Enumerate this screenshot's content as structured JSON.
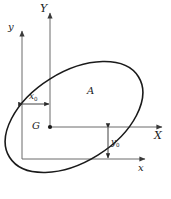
{
  "figure": {
    "background_color": "#ffffff",
    "stroke_color": "#1a1a1a",
    "axis_color": "#4a4a4a",
    "labels": {
      "axis_Y": "Y",
      "axis_y": "y",
      "axis_X": "X",
      "axis_x": "x",
      "centroid": "G",
      "area": "A",
      "offset_x": "x",
      "offset_x_sub": "0",
      "offset_y": "y",
      "offset_y_sub": "0"
    },
    "geometry": {
      "ellipse": {
        "center_x": 74,
        "center_y": 117,
        "radius_x": 76,
        "radius_y": 45,
        "rotation_deg": -32
      },
      "centroidal_axes": {
        "origin_x": 50,
        "origin_y": 127,
        "y_axis_top": 10,
        "x_axis_right": 166
      },
      "reference_axes": {
        "origin_x": 22,
        "origin_y": 159,
        "y_axis_top": 28,
        "x_axis_right": 149
      },
      "dimension_x0": {
        "from_x": 22,
        "to_x": 50,
        "at_y": 104
      },
      "dimension_y0": {
        "at_x": 108,
        "from_y": 127,
        "to_y": 159
      }
    }
  }
}
